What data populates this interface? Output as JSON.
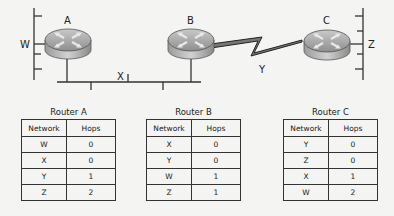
{
  "diagram": {
    "routers": [
      {
        "id": "A",
        "label": "A"
      },
      {
        "id": "B",
        "label": "B"
      },
      {
        "id": "C",
        "label": "C"
      }
    ],
    "networks": {
      "W": "W",
      "X": "X",
      "Y": "Y",
      "Z": "Z"
    }
  },
  "tables": [
    {
      "title": "Router A",
      "headers": [
        "Network",
        "Hops"
      ],
      "rows": [
        [
          "W",
          "0"
        ],
        [
          "X",
          "0"
        ],
        [
          "Y",
          "1"
        ],
        [
          "Z",
          "2"
        ]
      ]
    },
    {
      "title": "Router B",
      "headers": [
        "Network",
        "Hops"
      ],
      "rows": [
        [
          "X",
          "0"
        ],
        [
          "Y",
          "0"
        ],
        [
          "W",
          "1"
        ],
        [
          "Z",
          "1"
        ]
      ]
    },
    {
      "title": "Router C",
      "headers": [
        "Network",
        "Hops"
      ],
      "rows": [
        [
          "Y",
          "0"
        ],
        [
          "Z",
          "0"
        ],
        [
          "X",
          "1"
        ],
        [
          "W",
          "2"
        ]
      ]
    }
  ]
}
